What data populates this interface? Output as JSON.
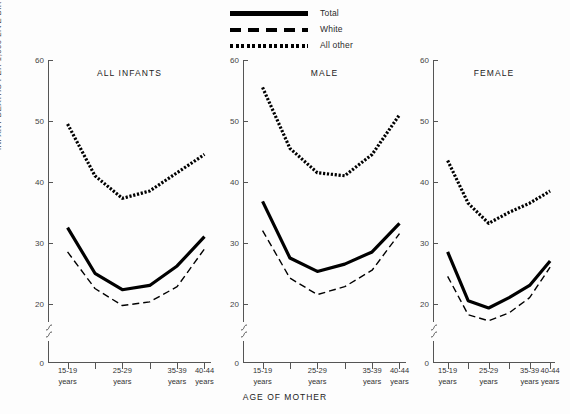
{
  "legend": {
    "items": [
      {
        "label": "Total",
        "style": "solid"
      },
      {
        "label": "White",
        "style": "dashed"
      },
      {
        "label": "All other",
        "style": "dotted"
      }
    ]
  },
  "axes": {
    "y_title": "INFANT DEATHS PER 1,000 LIVE BIRTHS",
    "x_title": "AGE OF MOTHER",
    "y_ticks": [
      "0",
      "20",
      "30",
      "40",
      "50",
      "60"
    ],
    "x_tick_labels": [
      {
        "line1": "15-19",
        "line2": "years"
      },
      {
        "line1": "25-29",
        "line2": "years"
      },
      {
        "line1": "35-39",
        "line2": "years"
      },
      {
        "line1": "40-44",
        "line2": "years"
      }
    ]
  },
  "chart_data": {
    "type": "line",
    "title": "",
    "xlabel": "AGE OF MOTHER",
    "ylabel": "INFANT DEATHS PER 1,000 LIVE BIRTHS",
    "ylim": [
      0,
      60
    ],
    "y_ticks": [
      0,
      20,
      30,
      40,
      50,
      60
    ],
    "axis_break": "between 0 and 17",
    "grid": false,
    "legend_position": "top-center",
    "categories": [
      "15-19 years",
      "20-24 years",
      "25-29 years",
      "30-34 years",
      "35-39 years",
      "40-44 years"
    ],
    "panels": [
      {
        "name": "ALL INFANTS",
        "series": [
          {
            "name": "Total",
            "style": "solid",
            "values": [
              32.5,
              25.0,
              22.3,
              23.0,
              26.2,
              31.0
            ]
          },
          {
            "name": "White",
            "style": "dashed",
            "values": [
              28.5,
              22.5,
              19.7,
              20.3,
              22.8,
              29.0
            ]
          },
          {
            "name": "All other",
            "style": "dotted",
            "values": [
              49.5,
              41.0,
              37.3,
              38.5,
              41.5,
              44.5
            ]
          }
        ]
      },
      {
        "name": "MALE",
        "series": [
          {
            "name": "Total",
            "style": "solid",
            "values": [
              36.8,
              27.5,
              25.3,
              26.5,
              28.5,
              33.2
            ]
          },
          {
            "name": "White",
            "style": "dashed",
            "values": [
              32.0,
              24.2,
              21.5,
              22.8,
              25.5,
              31.5
            ]
          },
          {
            "name": "All other",
            "style": "dotted",
            "values": [
              55.5,
              45.5,
              41.5,
              41.0,
              44.5,
              51.0
            ]
          }
        ]
      },
      {
        "name": "FEMALE",
        "series": [
          {
            "name": "Total",
            "style": "solid",
            "values": [
              28.5,
              20.5,
              19.3,
              21.0,
              23.0,
              27.0
            ]
          },
          {
            "name": "White",
            "style": "dashed",
            "values": [
              24.5,
              18.2,
              17.2,
              18.5,
              21.0,
              26.0
            ]
          },
          {
            "name": "All other",
            "style": "dotted",
            "values": [
              43.5,
              36.5,
              33.2,
              35.0,
              36.5,
              38.5
            ]
          }
        ]
      }
    ]
  },
  "panel_layout": [
    {
      "left": 48,
      "width": 163
    },
    {
      "left": 243,
      "width": 163
    },
    {
      "left": 433,
      "width": 122
    }
  ]
}
